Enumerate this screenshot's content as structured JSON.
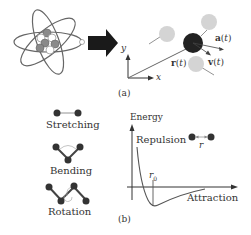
{
  "panel_a": {
    "caption": "(a)",
    "axis_x": "x",
    "axis_y": "y",
    "position_label": "r(t)",
    "velocity_label": "v(t)",
    "acceleration_label": "a(t)"
  },
  "panel_b": {
    "caption": "(b)",
    "modes": [
      {
        "label": "Stretching"
      },
      {
        "label": "Bending"
      },
      {
        "label": "Rotation"
      }
    ],
    "energy_axis_label": "Energy",
    "repulsion_label": "Repulsion",
    "attraction_label": "Attraction",
    "equilibrium_label": "r0",
    "distance_label": "r"
  },
  "colors": {
    "atom_dark": "#222222",
    "atom_gray": "#7a7a7a",
    "atom_light": "#d4d4d4",
    "line": "#555555",
    "arrow_fill": "#1a1a1a"
  }
}
